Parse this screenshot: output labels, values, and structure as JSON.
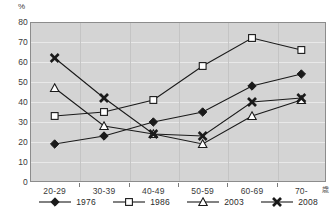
{
  "chart_data": {
    "type": "line",
    "title": "",
    "xlabel": "",
    "ylabel": "%",
    "y_unit_label": "%",
    "x_unit_label": "歳",
    "categories": [
      "20-29",
      "30-39",
      "40-49",
      "50-59",
      "60-69",
      "70-"
    ],
    "ylim": [
      0,
      80
    ],
    "ytick_step": 10,
    "yticks": [
      "80",
      "70",
      "60",
      "50",
      "40",
      "30",
      "20",
      "10",
      "0"
    ],
    "grid": true,
    "legend_position": "bottom",
    "series": [
      {
        "name": "1976",
        "marker": "diamond",
        "color": "#1a1a1a",
        "values": [
          19,
          23,
          30,
          35,
          48,
          54
        ]
      },
      {
        "name": "1986",
        "marker": "square",
        "color": "#1a1a1a",
        "values": [
          33,
          35,
          41,
          58,
          72,
          66
        ]
      },
      {
        "name": "2003",
        "marker": "triangle",
        "color": "#1a1a1a",
        "values": [
          47,
          28,
          24,
          19,
          33,
          41
        ]
      },
      {
        "name": "2008",
        "marker": "cross",
        "color": "#1a1a1a",
        "values": [
          62,
          42,
          24,
          23,
          40,
          42
        ]
      }
    ]
  },
  "colors": {
    "plot_background": "#d4d4d4",
    "page_background": "#ffffff",
    "gridline": "#e9e9e9",
    "axis": "#8c8c8c",
    "series": "#1a1a1a",
    "text": "#3a3a3a"
  }
}
